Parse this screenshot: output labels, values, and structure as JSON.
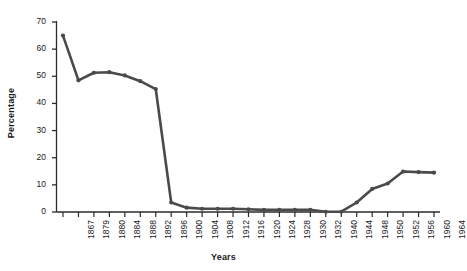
{
  "chart_data": {
    "type": "line",
    "title": "",
    "xlabel": "Years",
    "ylabel": "Percentage",
    "ylim": [
      0,
      70
    ],
    "yticks": [
      0,
      10,
      20,
      30,
      40,
      50,
      60,
      70
    ],
    "grid": false,
    "legend": null,
    "line_color": "#4a4a4a",
    "marker": "circle",
    "categories": [
      "1867",
      "1879",
      "1880",
      "1884",
      "1888",
      "1892",
      "1896",
      "1900",
      "1904",
      "1908",
      "1912",
      "1916",
      "1920",
      "1924",
      "1928",
      "1930",
      "1932",
      "1940",
      "1944",
      "1948",
      "1950",
      "1952",
      "1956",
      "1960",
      "1964"
    ],
    "values": [
      65,
      48.5,
      51.3,
      51.5,
      50.3,
      48.2,
      45.3,
      3.5,
      1.6,
      1.2,
      1.2,
      1.2,
      1.0,
      0.8,
      0.8,
      0.8,
      0.8,
      0.1,
      0.1,
      3.5,
      8.5,
      10.5,
      14.9,
      14.7,
      14.5
    ]
  }
}
